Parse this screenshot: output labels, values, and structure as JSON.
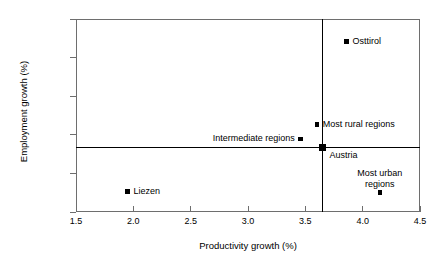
{
  "chart_data": {
    "type": "scatter",
    "title": "",
    "xlabel": "Productivity growth (%)",
    "ylabel": "Employment growth (%)",
    "xlim": [
      1.5,
      4.5
    ],
    "ylim": [
      -2.25,
      1.5
    ],
    "xticks": [
      "1.5",
      "2.0",
      "2.5",
      "3.0",
      "3.5",
      "4.0",
      "4.5"
    ],
    "yticks": [
      "1.50",
      "0.75",
      "0.00",
      "-0.75",
      "-1.50",
      "-2.25"
    ],
    "grid": false,
    "legend": "none",
    "marker_color": "#000000",
    "frame_color": "#6e6e6e",
    "reference_lines": {
      "vertical_x": 3.65,
      "horizontal_y": -1.0
    },
    "points": [
      {
        "label": "Osttirol",
        "x": 3.86,
        "y": 1.06,
        "label_pos": "right",
        "size": "small"
      },
      {
        "label": "Most rural regions",
        "x": 3.6,
        "y": -0.55,
        "label_pos": "right",
        "size": "small"
      },
      {
        "label": "Intermediate regions",
        "x": 3.46,
        "y": -0.83,
        "label_pos": "left",
        "size": "small"
      },
      {
        "label": "Austria",
        "x": 3.65,
        "y": -1.0,
        "label_pos": "right-below",
        "size": "large"
      },
      {
        "label": "Most urban regions",
        "x": 4.15,
        "y": -1.87,
        "label_pos": "above",
        "size": "small"
      },
      {
        "label": "Liezen",
        "x": 1.95,
        "y": -1.85,
        "label_pos": "right",
        "size": "small"
      }
    ]
  }
}
